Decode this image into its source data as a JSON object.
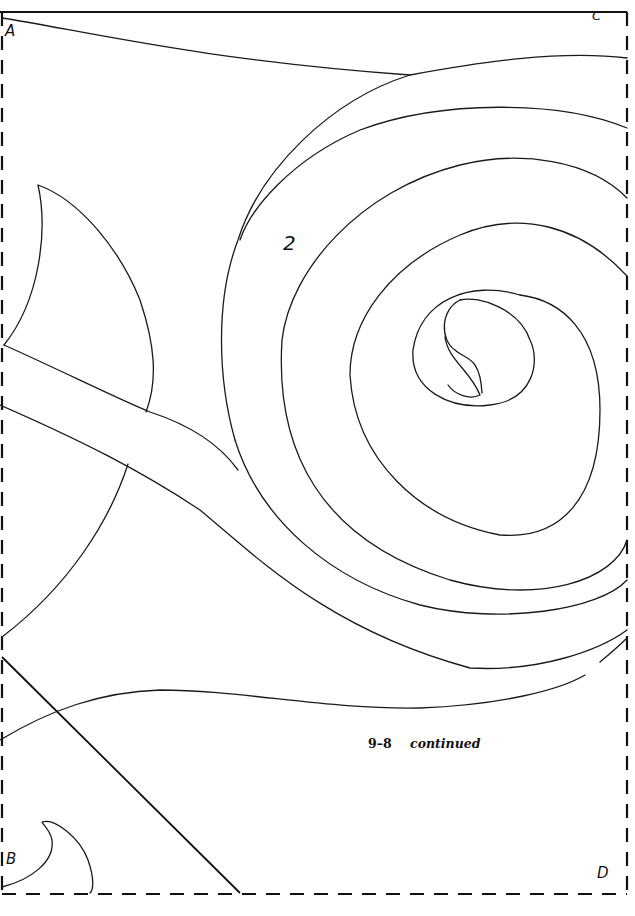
{
  "page": {
    "type": "quilting pattern template",
    "corner_labels": {
      "top_left": "A",
      "top_right": "C",
      "bottom_left": "B",
      "bottom_right": "D"
    },
    "piece_labels": [
      "2"
    ],
    "caption": {
      "figure": "9–8",
      "note": "continued"
    },
    "colors": {
      "ink": "#111111",
      "paper": "#ffffff"
    }
  }
}
